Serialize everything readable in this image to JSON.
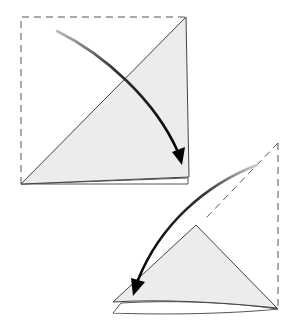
{
  "diagram": {
    "type": "origami-folding-steps",
    "steps": [
      {
        "id": "step-1",
        "description": "Square with dashed outline of unfolded top-left half; folded triangle shaded; curved arrow from top-left toward bottom-right corner",
        "fold_direction": "diagonal, top-left corner folded to bottom-right"
      },
      {
        "id": "step-2",
        "description": "Triangle with dashed outline of upper part; curved arrow from top-right down to bottom-left; stacked layers beneath",
        "fold_direction": "top corner folded down to bottom-left"
      }
    ],
    "colors": {
      "paper_fill": "#ececec",
      "line": "#444444",
      "dashed_line": "#555555",
      "arrow": "#111111",
      "background": "#ffffff"
    }
  }
}
